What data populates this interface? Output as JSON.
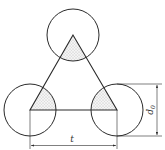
{
  "diagram": {
    "type": "triangular-pitch-layout",
    "colors": {
      "stroke": "#2a2a2a",
      "shade": "#bdbdbd",
      "background": "#ffffff"
    },
    "labels": {
      "pitch": "t",
      "diameter_main": "d",
      "diameter_sub": "0"
    },
    "circles": [
      {
        "name": "top",
        "cx": 73,
        "cy": 35,
        "r": 26
      },
      {
        "name": "bottom-left",
        "cx": 30,
        "cy": 110,
        "r": 26
      },
      {
        "name": "bottom-right",
        "cx": 117,
        "cy": 110,
        "r": 26
      }
    ]
  }
}
